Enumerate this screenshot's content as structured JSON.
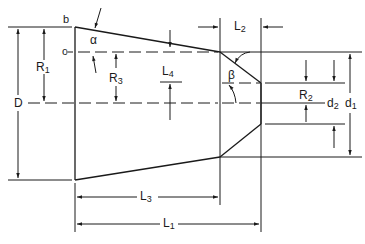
{
  "diagram": {
    "type": "technical-drawing",
    "colors": {
      "line": "#1a1a1a",
      "background": "#ffffff"
    },
    "labels": {
      "b": "b",
      "c": "c",
      "alpha": "α",
      "beta": "β",
      "R1": {
        "main": "R",
        "sub": "1"
      },
      "R2": {
        "main": "R",
        "sub": "2"
      },
      "R3": {
        "main": "R",
        "sub": "3"
      },
      "L1": {
        "main": "L",
        "sub": "1"
      },
      "L2": {
        "main": "L",
        "sub": "2"
      },
      "L3": {
        "main": "L",
        "sub": "3"
      },
      "L4": {
        "main": "L",
        "sub": "4"
      },
      "D": "D",
      "d1": {
        "main": "d",
        "sub": "1"
      },
      "d2": {
        "main": "d",
        "sub": "2"
      }
    }
  }
}
